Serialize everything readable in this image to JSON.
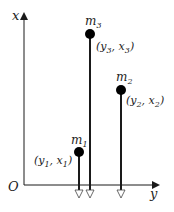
{
  "axes": {
    "vertical_label": "x",
    "horizontal_label": "y",
    "origin_label": "O"
  },
  "masses": [
    {
      "name": "m",
      "index": "1",
      "coord_y": "y",
      "coord_x": "x",
      "coord_index": "1",
      "px": 79,
      "py": 152
    },
    {
      "name": "m",
      "index": "2",
      "coord_y": "y",
      "coord_x": "x",
      "coord_index": "2",
      "px": 121,
      "py": 90
    },
    {
      "name": "m",
      "index": "3",
      "coord_y": "y",
      "coord_x": "x",
      "coord_index": "3",
      "px": 90,
      "py": 34
    }
  ],
  "colors": {
    "line": "#1a1a1a",
    "mass": "#000000",
    "background": "#ffffff"
  }
}
